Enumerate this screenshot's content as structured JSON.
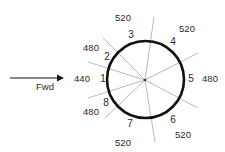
{
  "diagram": {
    "direction_label": "Fwd",
    "center": {
      "x": 145,
      "y": 80
    },
    "radius": 39,
    "colors": {
      "ring": "#111111",
      "rays": "#a8a8a8",
      "text": "#2a2a2a",
      "arrow": "#111111"
    },
    "segments": [
      {
        "number": "1",
        "value": "440"
      },
      {
        "number": "2",
        "value": "480"
      },
      {
        "number": "3",
        "value": "520"
      },
      {
        "number": "4",
        "value": "520"
      },
      {
        "number": "5",
        "value": "480"
      },
      {
        "number": "6",
        "value": "520"
      },
      {
        "number": "7",
        "value": "520"
      },
      {
        "number": "8",
        "value": "480"
      }
    ]
  }
}
